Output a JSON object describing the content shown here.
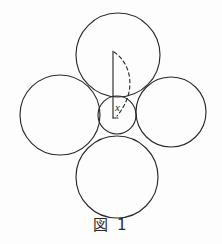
{
  "figure": {
    "caption": "図 1",
    "background_color": "#fdfdfd",
    "stroke_color": "#2b2b2b",
    "labels": {
      "radius_variable": "x"
    },
    "geometry": {
      "big_circles": [
        {
          "name": "top-circle",
          "cx": 118,
          "cy": 55,
          "r": 42
        },
        {
          "name": "left-circle",
          "cx": 60,
          "cy": 115,
          "r": 40
        },
        {
          "name": "right-circle",
          "cx": 171,
          "cy": 112,
          "r": 35
        },
        {
          "name": "bottom-circle",
          "cx": 117,
          "cy": 177,
          "r": 41
        }
      ],
      "small_circle": {
        "name": "center-circle",
        "cx": 117,
        "cy": 115,
        "r": 19
      },
      "radius_line": {
        "x1": 113,
        "y1": 51,
        "x2": 113,
        "y2": 118
      },
      "dashed_arc": {
        "from_x": 114,
        "from_y": 52,
        "ctrl_x": 136,
        "ctrl_y": 82,
        "to_x": 117,
        "to_y": 116
      }
    }
  }
}
